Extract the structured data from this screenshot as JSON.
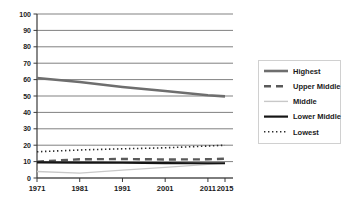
{
  "chart_data": {
    "type": "line",
    "title": "",
    "subtitle": "",
    "xlabel": "",
    "ylabel": "",
    "x": [
      1971,
      1981,
      1991,
      2001,
      2011,
      2015
    ],
    "categories": [
      "1971",
      "1981",
      "1991",
      "2001",
      "2011",
      "2015"
    ],
    "xtick_labels": [
      "1971",
      "1981",
      "1991",
      "2001",
      "2011",
      "2015"
    ],
    "ytick_labels": [
      "0",
      "10",
      "20",
      "30",
      "40",
      "50",
      "60",
      "70",
      "80",
      "90",
      "100"
    ],
    "ylim": [
      0,
      100
    ],
    "ytick_step": 10,
    "grid": true,
    "grid_axis": "y",
    "legend_position": "right",
    "series": [
      {
        "name": "Highest",
        "values": [
          61,
          58.5,
          55.5,
          53,
          50.5,
          49.8
        ],
        "color": "#6e6e6e",
        "style": "solid",
        "width": 2.6
      },
      {
        "name": "Upper Middle",
        "values": [
          10,
          11.4,
          11.6,
          11.3,
          11.4,
          11.8
        ],
        "color": "#5a5a5a",
        "style": "dashed",
        "width": 2.4
      },
      {
        "name": "Middle",
        "values": [
          4,
          3,
          4.8,
          6.5,
          8.3,
          9
        ],
        "color": "#c8c8c8",
        "style": "solid",
        "width": 1.4
      },
      {
        "name": "Lower Middle",
        "values": [
          9.5,
          9.4,
          9.3,
          9.1,
          9.0,
          9.0
        ],
        "color": "#151515",
        "style": "solid",
        "width": 2.2
      },
      {
        "name": "Lowest",
        "values": [
          16,
          17.1,
          17.8,
          18.4,
          19.5,
          20
        ],
        "color": "#2b2b2b",
        "style": "dotted",
        "width": 1.6
      }
    ]
  },
  "axes": {
    "y_axis_name": "value-axis",
    "x_axis_name": "year-axis"
  },
  "legend": {
    "items": [
      {
        "label": "Highest"
      },
      {
        "label": "Upper Middle"
      },
      {
        "label": "Middle"
      },
      {
        "label": "Lower Middle"
      },
      {
        "label": "Lowest"
      }
    ]
  },
  "colors": {
    "grid": "#4a4a4a",
    "axis": "#3a3a3a",
    "legend_border": "#d0d0d0",
    "background": "#ffffff"
  }
}
